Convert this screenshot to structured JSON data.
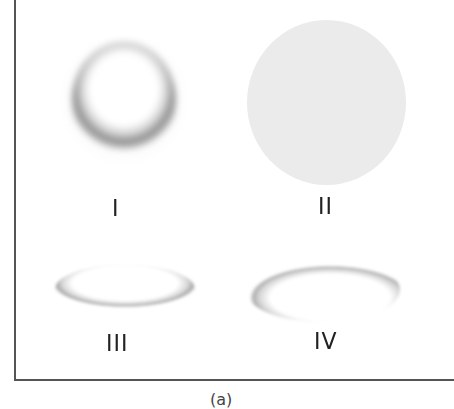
{
  "figure": {
    "panels": [
      {
        "label": "I",
        "description": "sphere lit from above with dark shadow crescent at bottom"
      },
      {
        "label": "II",
        "description": "flat uniform light gray disc"
      },
      {
        "label": "III",
        "description": "raised flat ellipse with shadow along bottom edge"
      },
      {
        "label": "IV",
        "description": "recessed ellipse with shadow along upper rim"
      }
    ],
    "caption": "(a)",
    "colors": {
      "frame": "#555555",
      "disc_fill": "#ebebeb",
      "shadow": "#8c8c8c",
      "label_text": "#222222"
    }
  }
}
